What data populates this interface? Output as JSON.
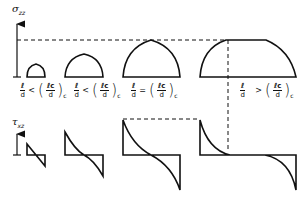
{
  "upper_axis": {
    "symbol": "σ",
    "subscript": "zz"
  },
  "lower_axis": {
    "symbol": "τ",
    "subscript": "xz"
  },
  "conditions": [
    {
      "lhs_num": "ℓ",
      "lhs_den": "d",
      "operator": "<",
      "rhs_num": "ℓc",
      "rhs_den": "d",
      "rhs_sub": "c"
    },
    {
      "lhs_num": "ℓ",
      "lhs_den": "d",
      "operator": "<",
      "rhs_num": "ℓc",
      "rhs_den": "d",
      "rhs_sub": "c"
    },
    {
      "lhs_num": "ℓ",
      "lhs_den": "d",
      "operator": "=",
      "rhs_num": "ℓc",
      "rhs_den": "d",
      "rhs_sub": "c"
    },
    {
      "lhs_num": "ℓ",
      "lhs_den": "d",
      "operator": ">",
      "rhs_num": "ℓc",
      "rhs_den": "d",
      "rhs_sub": "c"
    }
  ],
  "colors": {
    "stroke": "#111111",
    "background": "#ffffff"
  }
}
